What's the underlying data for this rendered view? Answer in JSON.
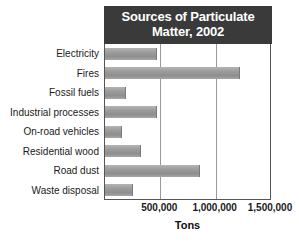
{
  "chart_data": {
    "type": "bar",
    "orientation": "horizontal",
    "title": "Sources of Particulate Matter, 2002",
    "title_line1": "Sources of Particulate",
    "title_line2": "Matter, 2002",
    "xlabel": "Tons",
    "ylabel": "",
    "xlim": [
      0,
      1500000
    ],
    "xticks": [
      500000,
      1000000,
      1500000
    ],
    "xtick_labels": [
      "500,000",
      "1,000,000",
      "1,500,000"
    ],
    "grid": true,
    "legend": "none",
    "categories": [
      "Electricity",
      "Fires",
      "Fossil fuels",
      "Industrial processes",
      "On-road vehicles",
      "Residential wood",
      "Road dust",
      "Waste disposal"
    ],
    "values": [
      470000,
      1220000,
      190000,
      470000,
      150000,
      325000,
      860000,
      255000
    ],
    "bar_color": "#9b9b9b",
    "title_background": "#3a3a3a",
    "title_color": "#ffffff",
    "gridline_color": "#9a9a9a",
    "axis_color": "#555555"
  }
}
